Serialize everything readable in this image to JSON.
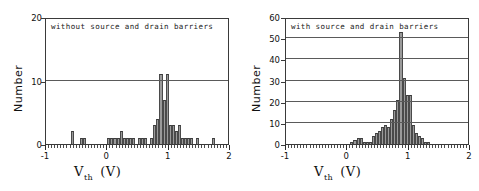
{
  "figure": {
    "axis_x_label_main": "V",
    "axis_x_label_sub": "th",
    "axis_x_label_unit": "(V)",
    "axis_y_label": "Number"
  },
  "chart_data": [
    {
      "type": "bar",
      "panel": "left",
      "title": "without source and drain barriers",
      "xlabel": "V_th (V)",
      "ylabel": "Number",
      "xlim": [
        -1,
        2
      ],
      "ylim": [
        0,
        20
      ],
      "xticks": [
        -1,
        0,
        1,
        2
      ],
      "yticks": [
        0,
        10,
        20
      ],
      "grid": true,
      "bin_width": 0.05,
      "bin_centers": [
        -0.975,
        -0.925,
        -0.875,
        -0.825,
        -0.775,
        -0.725,
        -0.675,
        -0.625,
        -0.575,
        -0.525,
        -0.475,
        -0.425,
        -0.375,
        -0.325,
        -0.275,
        -0.225,
        -0.175,
        -0.125,
        -0.075,
        -0.025,
        0.025,
        0.075,
        0.125,
        0.175,
        0.225,
        0.275,
        0.325,
        0.375,
        0.425,
        0.475,
        0.525,
        0.575,
        0.625,
        0.675,
        0.725,
        0.775,
        0.825,
        0.875,
        0.925,
        0.975,
        1.025,
        1.075,
        1.125,
        1.175,
        1.225,
        1.275,
        1.325,
        1.375,
        1.425,
        1.475,
        1.525,
        1.575,
        1.625,
        1.675,
        1.725,
        1.775,
        1.825,
        1.875,
        1.925,
        1.975
      ],
      "values": [
        0,
        0,
        0,
        0,
        0,
        0,
        0,
        0,
        2,
        0,
        0,
        1,
        1,
        0,
        0,
        0,
        0,
        0,
        0,
        0,
        1,
        1,
        1,
        1,
        2,
        1,
        1,
        1,
        1,
        0,
        1,
        1,
        1,
        0,
        1,
        3,
        4,
        11,
        7,
        11,
        3,
        3,
        2,
        3,
        1,
        1,
        1,
        1,
        0,
        1,
        0,
        0,
        0,
        0,
        1,
        0,
        0,
        0,
        0,
        0
      ],
      "peak_value": 11,
      "peak_position": 0.9
    },
    {
      "type": "bar",
      "panel": "right",
      "title": "with source and drain barriers",
      "xlabel": "V_th (V)",
      "ylabel": "Number",
      "xlim": [
        -1,
        2
      ],
      "ylim": [
        0,
        60
      ],
      "xticks": [
        -1,
        0,
        1,
        2
      ],
      "yticks": [
        0,
        10,
        20,
        30,
        40,
        50,
        60
      ],
      "grid": true,
      "bin_width": 0.05,
      "bin_centers": [
        -0.975,
        -0.925,
        -0.875,
        -0.825,
        -0.775,
        -0.725,
        -0.675,
        -0.625,
        -0.575,
        -0.525,
        -0.475,
        -0.425,
        -0.375,
        -0.325,
        -0.275,
        -0.225,
        -0.175,
        -0.125,
        -0.075,
        -0.025,
        0.025,
        0.075,
        0.125,
        0.175,
        0.225,
        0.275,
        0.325,
        0.375,
        0.425,
        0.475,
        0.525,
        0.575,
        0.625,
        0.675,
        0.725,
        0.775,
        0.825,
        0.875,
        0.925,
        0.975,
        1.025,
        1.075,
        1.125,
        1.175,
        1.225,
        1.275,
        1.325,
        1.375,
        1.425,
        1.475,
        1.525,
        1.575,
        1.625,
        1.675,
        1.725,
        1.775,
        1.825,
        1.875,
        1.925,
        1.975
      ],
      "values": [
        0,
        0,
        0,
        0,
        0,
        0,
        0,
        0,
        0,
        0,
        0,
        0,
        0,
        0,
        0,
        0,
        0,
        0,
        0,
        0,
        0,
        1,
        2,
        3,
        3,
        1,
        1,
        1,
        4,
        5,
        6,
        8,
        9,
        8,
        12,
        16,
        21,
        53,
        31,
        23,
        23,
        9,
        5,
        4,
        3,
        1,
        1,
        0,
        0,
        0,
        0,
        0,
        0,
        0,
        0,
        0,
        0,
        0,
        0,
        0
      ],
      "peak_value": 53,
      "peak_position": 0.85
    }
  ]
}
